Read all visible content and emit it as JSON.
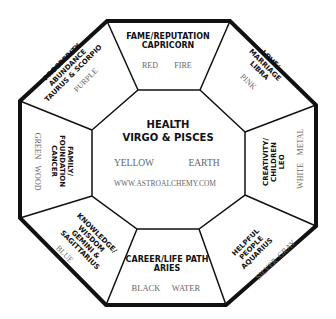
{
  "diagram": {
    "center": {
      "title": "HEALTH",
      "subtitle": "VIRGO & PISCES",
      "color": "YELLOW",
      "element": "EARTH",
      "website": "WWW.ASTROALCHEMY.COM"
    },
    "sectors": {
      "fame": {
        "lines": [
          "FAME/REPUTATION",
          "CAPRICORN"
        ],
        "color": "RED",
        "element": "FIRE"
      },
      "love": {
        "lines": [
          "LOVE/",
          "MARRIAGE",
          "LIBRA"
        ],
        "color": "PINK"
      },
      "creativity": {
        "lines": [
          "CREATIVITY/",
          "CHILDREN",
          "LEO"
        ],
        "color": "WHITE",
        "element": "METAL"
      },
      "helpful": {
        "lines": [
          "HELPFUL",
          "PEOPLE",
          "AQUARIUS"
        ],
        "color": "SILVER",
        "element": "GRAY"
      },
      "career": {
        "lines": [
          "CAREER/LIFE PATH",
          "ARIES"
        ],
        "color": "BLACK",
        "element": "WATER"
      },
      "knowledge": {
        "lines": [
          "KNOWLEDGE/",
          "WISDOM",
          "GEMINI &",
          "SAGITTARIUS"
        ],
        "color": "BLUE"
      },
      "family": {
        "lines": [
          "FAMILY/",
          "FOUNDATION",
          "CANCER"
        ],
        "color": "GREEN",
        "element": "WOOD"
      },
      "prosperity": {
        "lines": [
          "PROSPERITY",
          "ABUNDANCE",
          "TAURUS & SCORPIO"
        ],
        "color": "PURPLE"
      }
    }
  }
}
